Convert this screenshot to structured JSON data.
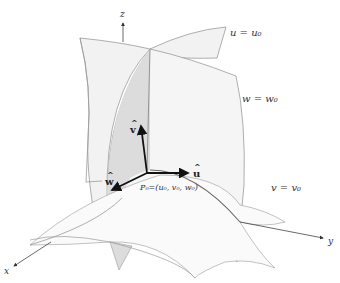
{
  "figure": {
    "axes": {
      "x_label": "x",
      "y_label": "y",
      "z_label": "z"
    },
    "surfaces": [
      {
        "name": "u-surface",
        "label": "u = u₀"
      },
      {
        "name": "w-surface",
        "label": "w = w₀"
      },
      {
        "name": "v-surface",
        "label": "v = v₀"
      }
    ],
    "unit_vectors": {
      "u": "û",
      "v": "ŵ​",
      "w": "ŵ"
    },
    "unit_vector_labels": {
      "u": "u",
      "v": "v",
      "w": "w"
    },
    "point_label": "P₀=(u₀, v₀, w₀)",
    "colors": {
      "surface_fill": "#f2f2f2",
      "surface_fill_dark": "#dcdcdc",
      "surface_edge": "#9a9a9a",
      "vector": "#111111",
      "axis": "#444444"
    }
  }
}
